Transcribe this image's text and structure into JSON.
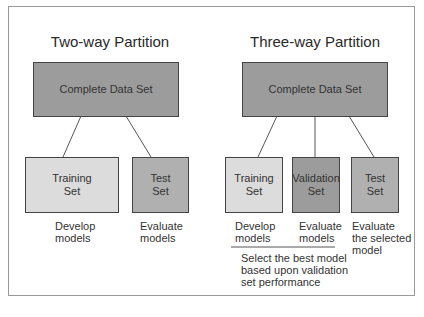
{
  "two_way": {
    "title": "Two-way Partition",
    "root": "Complete Data Set",
    "children": [
      {
        "label_1": "Training",
        "label_2": "Set",
        "caption_1": "Develop",
        "caption_2": "models"
      },
      {
        "label_1": "Test",
        "label_2": "Set",
        "caption_1": "Evaluate",
        "caption_2": "models"
      }
    ]
  },
  "three_way": {
    "title": "Three-way Partition",
    "root": "Complete Data Set",
    "children": [
      {
        "label_1": "Training",
        "label_2": "Set",
        "caption_1": "Develop",
        "caption_2": "models"
      },
      {
        "label_1": "Validation",
        "label_2": "Set",
        "caption_1": "Evaluate",
        "caption_2": "models"
      },
      {
        "label_1": "Test",
        "label_2": "Set",
        "caption_1": "Evaluate",
        "caption_2": "the selected",
        "caption_3": "model"
      }
    ],
    "note_1": "Select the best model",
    "note_2": "based upon validation",
    "note_3": "set performance"
  }
}
